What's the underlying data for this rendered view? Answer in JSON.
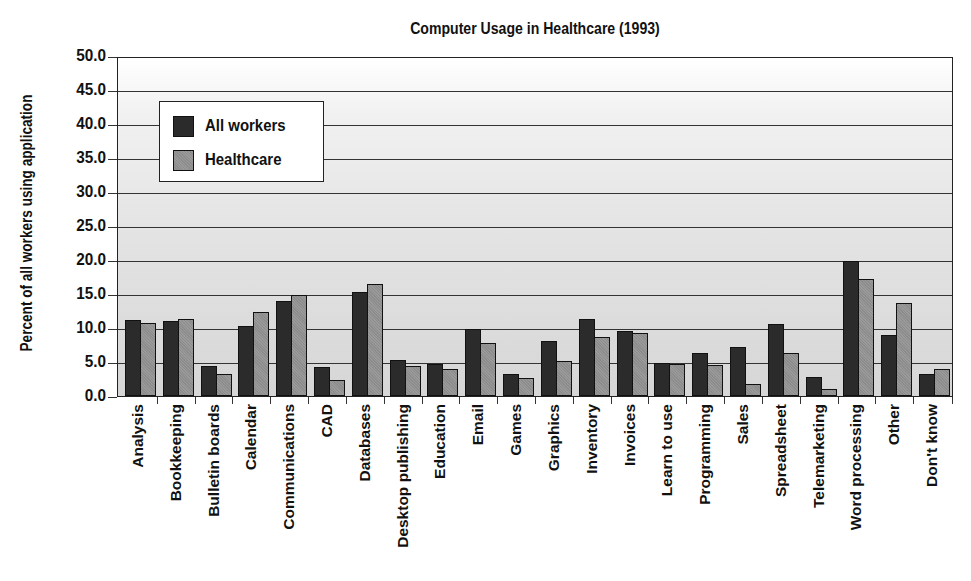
{
  "chart_data": {
    "type": "bar",
    "title": "Computer Usage in Healthcare (1993)",
    "xlabel": "",
    "ylabel": "Percent of all workers using application",
    "ylim": [
      0,
      50
    ],
    "yticks": [
      "0.0",
      "5.0",
      "10.0",
      "15.0",
      "20.0",
      "25.0",
      "30.0",
      "35.0",
      "40.0",
      "45.0",
      "50.0"
    ],
    "grid": true,
    "legend_position": "upper left",
    "categories": [
      "Analysis",
      "Bookkeeping",
      "Bulletin boards",
      "Calendar",
      "Communications",
      "CAD",
      "Databases",
      "Desktop publishing",
      "Education",
      "Email",
      "Games",
      "Graphics",
      "Inventory",
      "Invoices",
      "Learn to use",
      "Programming",
      "Sales",
      "Spreadsheet",
      "Telemarketing",
      "Word processing",
      "Other",
      "Don't know"
    ],
    "series": [
      {
        "name": "All workers",
        "color": "#2b2b2b",
        "values": [
          11.2,
          11.1,
          4.4,
          10.3,
          14.0,
          4.3,
          15.3,
          5.3,
          4.7,
          9.8,
          3.3,
          8.1,
          11.3,
          9.6,
          4.8,
          6.3,
          7.2,
          10.6,
          2.8,
          19.9,
          9.0,
          3.2
        ]
      },
      {
        "name": "Healthcare",
        "color": "#939393",
        "values": [
          10.7,
          11.3,
          3.2,
          12.3,
          14.9,
          2.4,
          16.4,
          4.4,
          3.9,
          7.8,
          2.7,
          5.2,
          8.7,
          9.2,
          4.7,
          4.6,
          1.7,
          6.3,
          1.0,
          17.2,
          13.7,
          3.9
        ]
      }
    ]
  }
}
